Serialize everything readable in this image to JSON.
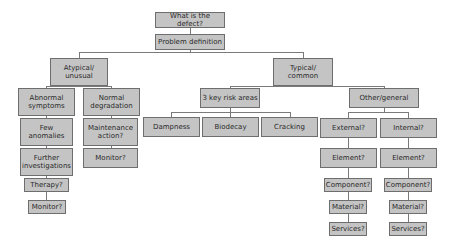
{
  "diagram": {
    "title_node": "What is the defect?",
    "nodes": {
      "root": "What is the defect?",
      "problem": "Problem definition",
      "atypical": "Atypical/\nunusual",
      "typical": "Typical/\ncommon",
      "abnormal": "Abnormal\nsymptoms",
      "normal": "Normal\ndegradation",
      "few": "Few\nanomalies",
      "further": "Further\ninvestigations",
      "therapy": "Therapy?",
      "monitor_left": "Monitor?",
      "maintenance": "Maintenance\naction?",
      "monitor_mid": "Monitor?",
      "risk": "3 key risk areas",
      "dampness": "Dampness",
      "biodecay": "Biodecay",
      "cracking": "Cracking",
      "other": "Other/general",
      "external": "External?",
      "internal": "Internal?",
      "element_ext": "Element?",
      "element_int": "Element?",
      "component_ext": "Component?",
      "component_int": "Component?",
      "material_ext": "Material?",
      "material_int": "Material?",
      "services_ext": "Services?",
      "services_int": "Services?"
    },
    "colors": {
      "node_fill": "#c4c4c4",
      "node_border": "#6e6e6e",
      "edge": "#7a7a7a",
      "text": "#2a2a2a"
    }
  }
}
